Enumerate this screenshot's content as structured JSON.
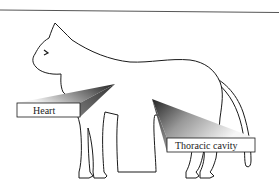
{
  "diagram": {
    "labels": [
      {
        "id": "heart",
        "text": "Heart"
      },
      {
        "id": "thoracic",
        "text": "Thoracic cavity"
      }
    ]
  },
  "colors": {
    "outline": "#1a1a1a",
    "pointer_dark": "#2a2a2a",
    "pointer_light": "#f2f2f2",
    "label_box": "#ffffff",
    "rule": "#555555"
  }
}
